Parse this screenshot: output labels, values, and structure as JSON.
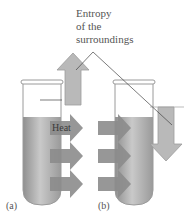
{
  "title_lines": [
    "Entropy",
    "of the",
    "surroundings"
  ],
  "heat_label": "Heat",
  "panels": [
    {
      "label": "(a)",
      "arrow_direction": "up"
    },
    {
      "label": "(b)",
      "arrow_direction": "down"
    }
  ],
  "colors": {
    "liquid": "#a9a9a9",
    "arrow": "#8a8a8a",
    "entropy_arrow": "#b8b8b8",
    "tube_outline": "#9a9a9a"
  }
}
